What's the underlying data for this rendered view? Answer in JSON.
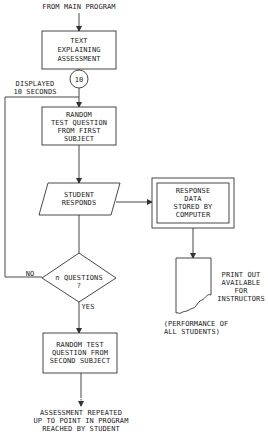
{
  "diagram": {
    "type": "flowchart",
    "entry_label": "FROM MAIN PROGRAM",
    "nodes": {
      "intro": {
        "shape": "process",
        "lines": [
          "TEXT",
          "EXPLAINING",
          "ASSESSMENT"
        ]
      },
      "timer": {
        "shape": "connector-circle",
        "label": "10"
      },
      "timer_note": {
        "lines": [
          "DISPLAYED",
          "10 SECONDS"
        ]
      },
      "q1": {
        "shape": "process",
        "lines": [
          "RANDOM",
          "TEST QUESTION",
          "FROM FIRST",
          "SUBJECT"
        ]
      },
      "respond": {
        "shape": "input-output",
        "lines": [
          "STUDENT",
          "RESPONDS"
        ]
      },
      "store": {
        "shape": "double-box",
        "lines": [
          "RESPONSE",
          "DATA",
          "STORED BY",
          "COMPUTER"
        ]
      },
      "decision": {
        "shape": "decision",
        "lines": [
          "n QUESTIONS",
          "?"
        ]
      },
      "printout": {
        "shape": "document",
        "lines": [
          "PRINT OUT",
          "AVAILABLE",
          "FOR",
          "INSTRUCTORS"
        ]
      },
      "printout_note": {
        "lines": [
          "(PERFORMANCE OF",
          "ALL STUDENTS)"
        ]
      },
      "q2": {
        "shape": "process",
        "lines": [
          "RANDOM TEST",
          "QUESTION FROM",
          "SECOND SUBJECT"
        ]
      },
      "exit": {
        "lines": [
          "ASSESSMENT REPEATED",
          "UP TO POINT IN PROGRAM",
          "REACHED BY STUDENT"
        ]
      }
    },
    "edge_labels": {
      "no": "NO",
      "yes": "YES"
    }
  }
}
